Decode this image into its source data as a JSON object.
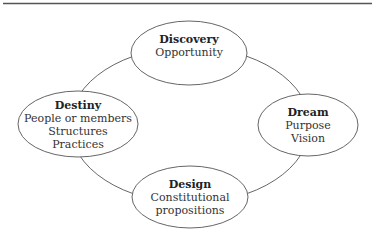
{
  "diagram": {
    "type": "cycle",
    "colors": {
      "stroke": "#666666",
      "rule": "#555555",
      "text": "#333333",
      "background": "#ffffff"
    },
    "nodes": [
      {
        "id": "discovery",
        "title": "Discovery",
        "lines": [
          "Opportunity"
        ]
      },
      {
        "id": "dream",
        "title": "Dream",
        "lines": [
          "Purpose",
          "Vision"
        ]
      },
      {
        "id": "design",
        "title": "Design",
        "lines": [
          "Constitutional",
          "propositions"
        ]
      },
      {
        "id": "destiny",
        "title": "Destiny",
        "lines": [
          "People or members",
          "Structures",
          "Practices"
        ]
      }
    ]
  }
}
